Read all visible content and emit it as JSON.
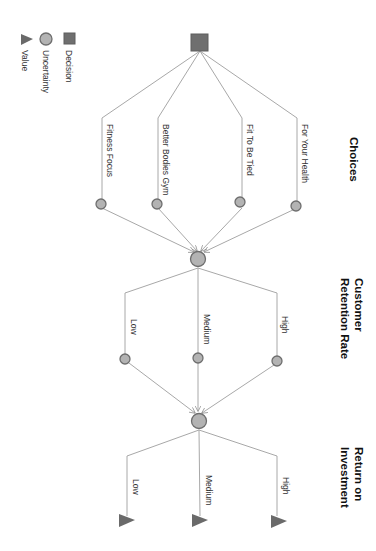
{
  "legend": {
    "decision": "Decision",
    "uncertainty": "Uncertainty",
    "value": "Value"
  },
  "headers": {
    "choices": "Choices",
    "retention_line1": "Customer",
    "retention_line2": "Retention Rate",
    "roi_line1": "Return on",
    "roi_line2": "Investment"
  },
  "choices": [
    {
      "label": "Fitness Focus"
    },
    {
      "label": "Better Bodies Gym"
    },
    {
      "label": "Fit To Be Tied"
    },
    {
      "label": "For Your Health"
    }
  ],
  "retention_rates": [
    {
      "label": "Low"
    },
    {
      "label": "Medium"
    },
    {
      "label": "High"
    }
  ],
  "roi_levels": [
    {
      "label": "Low"
    },
    {
      "label": "Medium"
    },
    {
      "label": "High"
    }
  ],
  "colors": {
    "decision_node": "#6f6f6f",
    "uncertainty_node": "#b3b3b3",
    "value_node": "#6a6a6a",
    "edge": "#a8a8a8"
  }
}
